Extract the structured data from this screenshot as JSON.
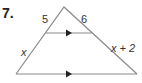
{
  "problem": {
    "number": "7.",
    "labels": {
      "upper_left_segment": "5",
      "upper_right_segment": "6",
      "lower_left_segment": "x",
      "lower_right_segment": "x + 2"
    }
  },
  "colors": {
    "lines": "#8a8a8a",
    "arrows": "#222222",
    "text": "#333333"
  }
}
